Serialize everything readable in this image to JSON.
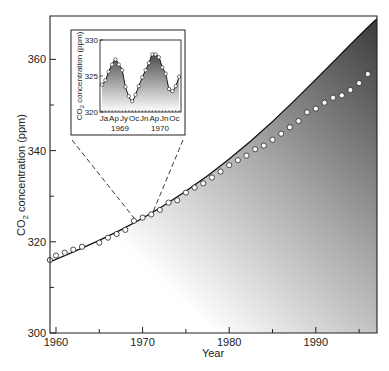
{
  "chart_data": [
    {
      "id": "main",
      "type": "line",
      "title": "",
      "xlabel": "Year",
      "ylabel": "CO2 concentration (ppm)",
      "ylabel_parts": {
        "pre": "CO",
        "sub": "2",
        "post": " concentration (ppm)"
      },
      "xlim": [
        1959.3,
        1997.1
      ],
      "ylim": [
        300,
        369
      ],
      "x_ticks": [
        1960,
        1970,
        1980,
        1990
      ],
      "x_tick_labels": [
        "1960",
        "1970",
        "1980",
        "1990"
      ],
      "x_minor_ticks": [
        1965,
        1975,
        1985,
        1995
      ],
      "y_ticks": [
        300,
        320,
        340,
        360
      ],
      "y_tick_labels": [
        "300",
        "320",
        "340",
        "360"
      ],
      "y_minor_ticks": [
        310,
        330,
        350
      ],
      "grid": false,
      "series": [
        {
          "name": "Annual mean CO2 (observed)",
          "style": "open-circle-markers",
          "x": [
            1959.3,
            1960,
            1961,
            1962,
            1963,
            1965,
            1966,
            1967,
            1968,
            1969,
            1970,
            1971,
            1972,
            1973,
            1974,
            1975,
            1976,
            1977,
            1978,
            1979,
            1980,
            1981,
            1982,
            1983,
            1984,
            1985,
            1986,
            1987,
            1988,
            1989,
            1990,
            1991,
            1992,
            1993,
            1994,
            1995,
            1996
          ],
          "values": [
            316.0,
            317.0,
            317.6,
            318.3,
            318.9,
            319.8,
            320.9,
            321.7,
            322.6,
            324.6,
            325.3,
            326.0,
            327.0,
            328.6,
            329.1,
            330.8,
            331.9,
            332.8,
            334.1,
            335.4,
            336.8,
            337.9,
            338.9,
            340.3,
            341.1,
            342.4,
            343.7,
            345.1,
            346.5,
            348.4,
            349.2,
            350.5,
            351.6,
            352.1,
            353.3,
            354.8,
            356.8
          ]
        },
        {
          "name": "Fitted exponential trend",
          "style": "solid-line",
          "x": [
            1959.3,
            1965,
            1970,
            1975,
            1980,
            1985,
            1990,
            1995,
            1997.1
          ],
          "values": [
            315.6,
            320.2,
            325.0,
            331.0,
            338.0,
            346.2,
            355.6,
            365.2,
            369.0
          ]
        }
      ],
      "annotations": [
        "Shaded gradient region below fitted curve",
        "Dashed zoom lines from inset to 1969-1970 segment"
      ]
    },
    {
      "id": "inset",
      "type": "line",
      "title": "",
      "xlabel": "",
      "ylabel": "CO2 concentration (ppm)",
      "ylabel_parts": {
        "pre": "CO",
        "sub": "2",
        "post": " concentration (ppm)"
      },
      "ylim": [
        320,
        330
      ],
      "y_ticks": [
        320,
        325,
        330
      ],
      "y_tick_labels": [
        "320",
        "325",
        "330"
      ],
      "x_tick_labels": [
        "Ja",
        "Ap",
        "Jy",
        "Oc",
        "Jn",
        "Ap",
        "Jn",
        "Oc"
      ],
      "x_year_labels": [
        "1969",
        "1970"
      ],
      "grid": false,
      "series": [
        {
          "name": "Monthly mean CO2 1969-1970",
          "style": "open-circle-markers-with-line",
          "x": [
            0,
            1,
            2,
            3,
            4,
            5,
            6,
            7,
            8,
            9,
            10,
            11,
            12,
            13,
            14,
            15,
            16,
            17,
            18,
            19,
            20,
            21,
            22,
            23
          ],
          "values": [
            323.8,
            324.4,
            325.6,
            326.6,
            327.3,
            326.6,
            325.8,
            323.5,
            322.2,
            321.5,
            322.4,
            323.6,
            324.8,
            325.8,
            326.8,
            328.0,
            328.0,
            327.6,
            326.2,
            325.3,
            323.2,
            322.9,
            323.6,
            324.9
          ]
        }
      ]
    }
  ]
}
